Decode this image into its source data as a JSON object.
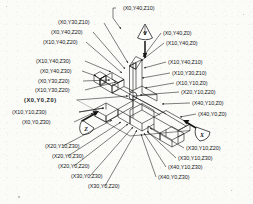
{
  "figure": {
    "type": "technical-line-drawing",
    "background_color": "#fbfbf8",
    "line_color": "#141414"
  },
  "axes": [
    {
      "id": "y-axis",
      "letter": "Y",
      "badge": "teardrop",
      "position": "top-center"
    },
    {
      "id": "z-axis",
      "letter": "Z",
      "badge": "teardrop",
      "position": "lower-left"
    },
    {
      "id": "x-axis",
      "letter": "X",
      "badge": "teardrop",
      "position": "lower-right"
    }
  ],
  "labels": {
    "top": [
      {
        "id": "l-x0y40z10",
        "text": "(X0,Y40,Z10)"
      }
    ],
    "upper_left": [
      {
        "id": "l-x0y30z10",
        "text": "(X0,Y30,Z10)"
      },
      {
        "id": "l-x0y40z20",
        "text": "(X0,Y40,Z20)"
      },
      {
        "id": "l-x10y40z20",
        "text": "(X10,Y40,Z20)"
      },
      {
        "id": "l-x10y40z30",
        "text": "(X10,Y40,Z30)"
      },
      {
        "id": "l-x0y40z30",
        "text": "(X0,Y40,Z30)"
      },
      {
        "id": "l-x0y30z20",
        "text": "(X0,Y30,Z20)"
      },
      {
        "id": "l-x10y30z20",
        "text": "(X10,Y30,Z20)"
      }
    ],
    "left_origin": [
      {
        "id": "l-origin",
        "text": "(X0,Y0,Z0)",
        "bold": true
      },
      {
        "id": "l-x10y10z30",
        "text": "(X10,Y10,Z30)"
      },
      {
        "id": "l-x0y0z30",
        "text": "(X0,Y0,Z30)"
      }
    ],
    "upper_right": [
      {
        "id": "l-x0y40z0",
        "text": "(X0,Y40,Z0)"
      },
      {
        "id": "l-x10y40z0",
        "text": "(X10,Y40,Z0)"
      },
      {
        "id": "l-x10y40z10",
        "text": "(X10,Y40,Z10)"
      },
      {
        "id": "l-x10y30z10",
        "text": "(X10,Y30,Z10)"
      },
      {
        "id": "l-x10y10z0",
        "text": "(X10,Y10,Z0)"
      },
      {
        "id": "l-x20y10z20",
        "text": "(X20,Y10,Z20)"
      },
      {
        "id": "l-x40y10z0",
        "text": "(X40,Y10,Z0)"
      },
      {
        "id": "l-x40y0z0",
        "text": "(X40,Y0,Z0)"
      }
    ],
    "lower_left": [
      {
        "id": "l-x20y10z30",
        "text": "(X20,Y10,Z30)"
      },
      {
        "id": "l-x20y0z30",
        "text": "(X20,Y0,Z30)"
      },
      {
        "id": "l-x20y0z20",
        "text": "(X20,Y0,Z20)"
      },
      {
        "id": "l-x30y0z30",
        "text": "(X30,Y0,Z30)"
      },
      {
        "id": "l-x30y0z20",
        "text": "(X30,Y0,Z20)"
      }
    ],
    "lower_right": [
      {
        "id": "l-x30y10z20",
        "text": "(X30,Y10,Z20)"
      },
      {
        "id": "l-x30y10z30",
        "text": "(X30,Y10,Z30)"
      },
      {
        "id": "l-x40y10z30",
        "text": "(X40,Y10,Z30)"
      },
      {
        "id": "l-x40y0z30",
        "text": "(X40,Y0,Z30)"
      }
    ]
  }
}
